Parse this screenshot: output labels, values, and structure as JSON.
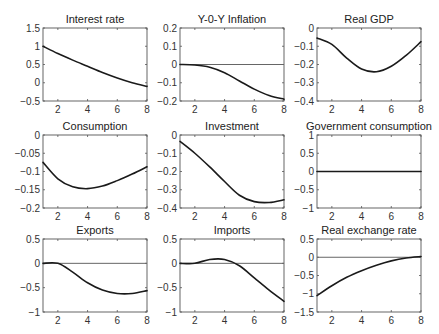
{
  "chart_data": [
    {
      "type": "line",
      "title": "Interest rate",
      "x": [
        1,
        2,
        3,
        4,
        5,
        6,
        7,
        8
      ],
      "values": [
        1.0,
        0.8,
        0.62,
        0.45,
        0.28,
        0.13,
        0.0,
        -0.1
      ],
      "xlim": [
        1,
        8
      ],
      "ylim": [
        -0.5,
        1.5
      ],
      "xticks": [
        "2",
        "4",
        "6",
        "8"
      ],
      "yticks": [
        "1.5",
        "1",
        "0.5",
        "0",
        "-0.5"
      ],
      "zero_line": false
    },
    {
      "type": "line",
      "title": "Y-0-Y Inflation",
      "x": [
        1,
        2,
        3,
        4,
        5,
        6,
        7,
        8
      ],
      "values": [
        0.0,
        -0.003,
        -0.015,
        -0.045,
        -0.09,
        -0.135,
        -0.17,
        -0.19
      ],
      "xlim": [
        1,
        8
      ],
      "ylim": [
        -0.2,
        0.2
      ],
      "xticks": [
        "2",
        "4",
        "6",
        "8"
      ],
      "yticks": [
        "0.2",
        "0.1",
        "0",
        "-0.1",
        "-0.2"
      ],
      "zero_line": true
    },
    {
      "type": "line",
      "title": "Real GDP",
      "x": [
        1,
        2,
        3,
        4,
        5,
        6,
        7,
        8
      ],
      "values": [
        -0.055,
        -0.09,
        -0.165,
        -0.225,
        -0.24,
        -0.21,
        -0.15,
        -0.075
      ],
      "xlim": [
        1,
        8
      ],
      "ylim": [
        -0.4,
        0
      ],
      "xticks": [
        "2",
        "4",
        "6",
        "8"
      ],
      "yticks": [
        "0",
        "-0.1",
        "-0.2",
        "-0.3",
        "-0.4"
      ],
      "zero_line": false
    },
    {
      "type": "line",
      "title": "Consumption",
      "x": [
        1,
        2,
        3,
        4,
        5,
        6,
        7,
        8
      ],
      "values": [
        -0.075,
        -0.12,
        -0.142,
        -0.147,
        -0.14,
        -0.125,
        -0.107,
        -0.087
      ],
      "xlim": [
        1,
        8
      ],
      "ylim": [
        -0.2,
        0
      ],
      "xticks": [
        "2",
        "4",
        "6",
        "8"
      ],
      "yticks": [
        "0",
        "-0.05",
        "-0.1",
        "-0.15",
        "-0.2"
      ],
      "zero_line": false
    },
    {
      "type": "line",
      "title": "Investment",
      "x": [
        1,
        2,
        3,
        4,
        5,
        6,
        7,
        8
      ],
      "values": [
        -0.035,
        -0.1,
        -0.175,
        -0.255,
        -0.33,
        -0.365,
        -0.37,
        -0.355
      ],
      "xlim": [
        1,
        8
      ],
      "ylim": [
        -0.4,
        0
      ],
      "xticks": [
        "2",
        "4",
        "6",
        "8"
      ],
      "yticks": [
        "0",
        "-0.1",
        "-0.2",
        "-0.3",
        "-0.4"
      ],
      "zero_line": false
    },
    {
      "type": "line",
      "title": "Government consumption",
      "x": [
        1,
        2,
        3,
        4,
        5,
        6,
        7,
        8
      ],
      "values": [
        0,
        0,
        0,
        0,
        0,
        0,
        0,
        0
      ],
      "xlim": [
        1,
        8
      ],
      "ylim": [
        -1,
        1
      ],
      "xticks": [
        "2",
        "4",
        "6",
        "8"
      ],
      "yticks": [
        "1",
        "0.5",
        "0",
        "-0.5",
        "-1"
      ],
      "zero_line": true
    },
    {
      "type": "line",
      "title": "Exports",
      "x": [
        1,
        2,
        3,
        4,
        5,
        6,
        7,
        8
      ],
      "values": [
        0.0,
        0.0,
        -0.18,
        -0.4,
        -0.55,
        -0.62,
        -0.62,
        -0.56
      ],
      "xlim": [
        1,
        8
      ],
      "ylim": [
        -1,
        0.5
      ],
      "xticks": [
        "2",
        "4",
        "6",
        "8"
      ],
      "yticks": [
        "0.5",
        "0",
        "-0.5",
        "-1"
      ],
      "zero_line": true
    },
    {
      "type": "line",
      "title": "Imports",
      "x": [
        1,
        2,
        3,
        4,
        5,
        6,
        7,
        8
      ],
      "values": [
        0.0,
        0.0,
        0.08,
        0.08,
        -0.05,
        -0.3,
        -0.55,
        -0.78
      ],
      "xlim": [
        1,
        8
      ],
      "ylim": [
        -1,
        0.5
      ],
      "xticks": [
        "2",
        "4",
        "6",
        "8"
      ],
      "yticks": [
        "0.5",
        "0",
        "-0.5",
        "-1"
      ],
      "zero_line": true
    },
    {
      "type": "line",
      "title": "Real exchange rate",
      "x": [
        1,
        2,
        3,
        4,
        5,
        6,
        7,
        8
      ],
      "values": [
        -1.05,
        -0.78,
        -0.55,
        -0.37,
        -0.22,
        -0.1,
        -0.02,
        0.02
      ],
      "xlim": [
        1,
        8
      ],
      "ylim": [
        -1.5,
        0.5
      ],
      "xticks": [
        "2",
        "4",
        "6",
        "8"
      ],
      "yticks": [
        "0.5",
        "0",
        "-0.5",
        "-1",
        "-1.5"
      ],
      "zero_line": true
    }
  ],
  "layout": {
    "cols": [
      43,
      180,
      317
    ],
    "rows": [
      28,
      135,
      239
    ],
    "width": 104,
    "height": 73
  }
}
